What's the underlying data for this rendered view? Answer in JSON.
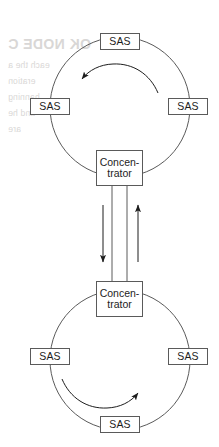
{
  "diagram": {
    "stroke_color": "#5a5a5a",
    "arrow_color": "#1d1d1d",
    "text_color": "#1d1d1d",
    "background_color": "#ffffff",
    "rings": [
      {
        "id": "upper-ring",
        "name": "upper-ring",
        "center": {
          "x": 120,
          "y": 107
        },
        "radius": 70,
        "rotation_direction": "counter-clockwise",
        "nodes": [
          {
            "id": "upper-ring-sas-top",
            "label": "SAS",
            "x": 100,
            "y": 33,
            "position": "top"
          },
          {
            "id": "upper-ring-sas-left",
            "label": "SAS",
            "x": 30,
            "y": 98,
            "position": "left"
          },
          {
            "id": "upper-ring-sas-right",
            "label": "SAS",
            "x": 168,
            "y": 98,
            "position": "right"
          },
          {
            "id": "upper-ring-concentrator",
            "label_line1": "Concen-",
            "label_line2": "trator",
            "x": 96,
            "y": 150,
            "position": "bottom"
          }
        ]
      },
      {
        "id": "lower-ring",
        "name": "lower-ring",
        "center": {
          "x": 120,
          "y": 360
        },
        "radius": 70,
        "rotation_direction": "clockwise",
        "nodes": [
          {
            "id": "lower-ring-concentrator",
            "label_line1": "Concen-",
            "label_line2": "trator",
            "x": 96,
            "y": 281,
            "position": "top"
          },
          {
            "id": "lower-ring-sas-left",
            "label": "SAS",
            "x": 30,
            "y": 348,
            "position": "left"
          },
          {
            "id": "lower-ring-sas-right",
            "label": "SAS",
            "x": 168,
            "y": 348,
            "position": "right"
          },
          {
            "id": "lower-ring-sas-bottom",
            "label": "SAS",
            "x": 100,
            "y": 416,
            "position": "bottom"
          }
        ]
      }
    ],
    "trunk": {
      "name": "concentrator-trunk",
      "left_line_x": 112,
      "right_line_x": 126,
      "top_y": 186,
      "bottom_y": 281,
      "arrows": [
        {
          "id": "trunk-arrow-down",
          "x": 103,
          "from_y": 205,
          "to_y": 262,
          "direction": "down"
        },
        {
          "id": "trunk-arrow-up",
          "x": 138,
          "from_y": 262,
          "to_y": 205,
          "direction": "up"
        }
      ]
    },
    "ring_arrows": [
      {
        "id": "upper-ring-direction-arrow",
        "ring": "upper-ring",
        "direction": "counter-clockwise"
      },
      {
        "id": "lower-ring-direction-arrow",
        "ring": "lower-ring",
        "direction": "clockwise"
      }
    ]
  },
  "bleed_through": {
    "note": "faint mirrored show-through text from the reverse side of the scanned page",
    "lines": [
      {
        "text": "OK NODE C",
        "x": 8,
        "y": 36,
        "style": "head"
      },
      {
        "text": "each the a",
        "x": 8,
        "y": 60,
        "style": "body"
      },
      {
        "text": "eration",
        "x": 8,
        "y": 76,
        "style": "body"
      },
      {
        "text": "hanning",
        "x": 8,
        "y": 92,
        "style": "body"
      },
      {
        "text": "and he",
        "x": 8,
        "y": 108,
        "style": "body"
      },
      {
        "text": "are",
        "x": 8,
        "y": 124,
        "style": "body"
      }
    ]
  }
}
